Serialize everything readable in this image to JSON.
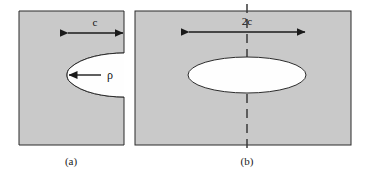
{
  "figure": {
    "type": "scientific-diagram",
    "background_color": "#ffffff",
    "body_fill_color": "#c9c9c9",
    "void_fill_color": "#fefefe",
    "line_color": "#2b2b2b"
  },
  "panels": [
    {
      "id": "a",
      "caption": "(a)",
      "description": "rectangular body with a surface notch opening on the right edge, rounded crack tip",
      "dimension_label": "c",
      "tip_radius_label": "ρ",
      "has_centerline": false,
      "geometry": {
        "rect": {
          "x": 19,
          "y": 11,
          "width": 105,
          "height": 134
        },
        "notch_tip_x": 67,
        "notch_mid_y": 75,
        "notch_half_height": 22
      },
      "dimension_arrow": {
        "y": 33,
        "x_start": 67,
        "x_end": 124,
        "double_headed": true
      },
      "rho_arrow": {
        "y": 75,
        "x_start": 100,
        "x_end": 68,
        "double_headed": false
      }
    },
    {
      "id": "b",
      "caption": "(b)",
      "description": "rectangular body with an internal elliptical crack and a vertical dashed centerline",
      "dimension_label": "2c",
      "has_centerline": true,
      "geometry": {
        "rect": {
          "x": 135,
          "y": 11,
          "width": 216,
          "height": 134
        },
        "ellipse": {
          "cx": 247,
          "cy": 75,
          "rx": 59,
          "ry": 18
        }
      },
      "dimension_arrow": {
        "y": 32,
        "x_start": 188,
        "x_end": 306,
        "double_headed": true
      },
      "centerline": {
        "x": 247,
        "y_start": 4,
        "y_end": 152
      }
    }
  ],
  "labels": {
    "panel_a_dimension": "c",
    "panel_a_tip_radius": "ρ",
    "panel_b_dimension": "2c",
    "panel_a_caption": "(a)",
    "panel_b_caption": "(b)"
  }
}
